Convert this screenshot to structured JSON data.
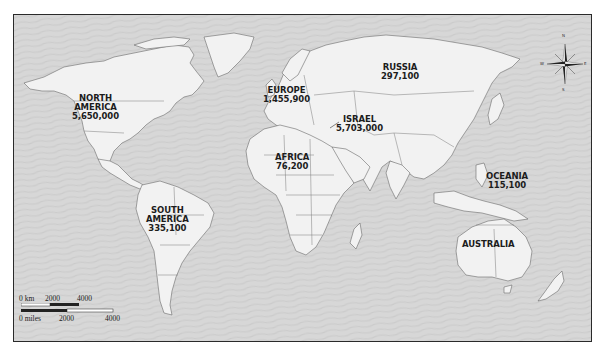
{
  "map": {
    "type": "world-political-outline",
    "colors": {
      "ocean": "#d7d7d7",
      "land": "#f2f2f2",
      "border": "#6a6a6a",
      "frame": "#2a2a2a",
      "label": "#1c1c1c"
    },
    "regions": [
      {
        "id": "north-america",
        "name": "NORTH\nAMERICA",
        "line1": "NORTH",
        "line2": "AMERICA",
        "value": "5,650,000"
      },
      {
        "id": "europe",
        "line1": "EUROPE",
        "value": "1,455,900"
      },
      {
        "id": "russia",
        "line1": "RUSSIA",
        "value": "297,100"
      },
      {
        "id": "israel",
        "line1": "ISRAEL",
        "value": "5,703,000"
      },
      {
        "id": "africa",
        "line1": "AFRICA",
        "value": "76,200"
      },
      {
        "id": "south-america",
        "line1": "SOUTH",
        "line2": "AMERICA",
        "value": "335,100"
      },
      {
        "id": "oceania",
        "line1": "OCEANIA",
        "value": "115,100"
      },
      {
        "id": "australia",
        "line1": "AUSTRALIA"
      }
    ],
    "compass": {
      "n": "N",
      "s": "S",
      "e": "E",
      "w": "W"
    },
    "scale_bar": {
      "km_label": "0 km",
      "km_ticks": [
        "2000",
        "4000"
      ],
      "miles_label": "0 miles",
      "miles_ticks": [
        "2000",
        "4000"
      ]
    }
  }
}
